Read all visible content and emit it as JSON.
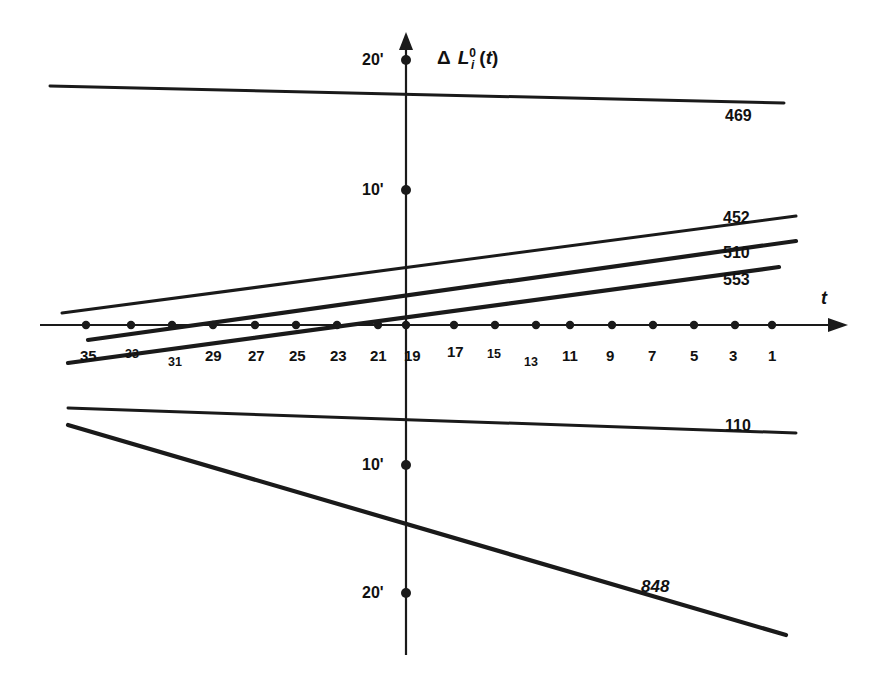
{
  "chart_data": {
    "type": "line",
    "title": "",
    "xlabel": "t",
    "ylabel": "Δ L i 0 (t)",
    "ylabel_parts": {
      "delta": "Δ",
      "base": "L",
      "superscript": "0",
      "subscript": "i",
      "argument": "(t)"
    },
    "x_axis": {
      "direction": "decreasing left to right",
      "tick_values": [
        35,
        33,
        31,
        29,
        27,
        25,
        23,
        21,
        19,
        17,
        15,
        13,
        11,
        9,
        7,
        5,
        3,
        1
      ],
      "tick_labels": [
        "35",
        "33",
        "31",
        "29",
        "27",
        "25",
        "23",
        "21",
        "19",
        "17",
        "15",
        "13",
        "11",
        "9",
        "7",
        "5",
        "3",
        "1"
      ],
      "axis_arrow": true,
      "origin_tick": "19"
    },
    "y_axis": {
      "tick_labels": [
        "20'",
        "10'",
        "10'",
        "20'"
      ],
      "tick_values": [
        20,
        10,
        -10,
        -20
      ],
      "unit": "'",
      "axis_arrow": true
    },
    "grid": false,
    "legend": "inline right-edge labels",
    "series": [
      {
        "name": "469",
        "label": "469",
        "style": "near-horizontal slight downward to the right",
        "points": [
          {
            "x": 35.8,
            "y": 19.0
          },
          {
            "x": 0.2,
            "y": 17.6
          }
        ]
      },
      {
        "name": "452",
        "label": "452",
        "style": "rising to the right",
        "points": [
          {
            "x": 35.3,
            "y": 0.9
          },
          {
            "x": 0.6,
            "y": 8.4
          }
        ]
      },
      {
        "name": "510",
        "label": "510",
        "style": "rising to the right, crosses axis near t=28",
        "points": [
          {
            "x": 34.0,
            "y": -1.3
          },
          {
            "x": 0.6,
            "y": 7.4
          }
        ]
      },
      {
        "name": "553",
        "label": "553",
        "style": "steeply rising, crosses axis near t=11",
        "points": [
          {
            "x": 35.0,
            "y": -3.4
          },
          {
            "x": 1.4,
            "y": 5.3
          }
        ]
      },
      {
        "name": "110",
        "label": "110",
        "style": "nearly horizontal, slight decline to the right",
        "points": [
          {
            "x": 35.0,
            "y": -6.4
          },
          {
            "x": 0.6,
            "y": -7.6
          }
        ]
      },
      {
        "name": "848",
        "label": "848",
        "style": "steeply falling to the right",
        "points": [
          {
            "x": 35.0,
            "y": -8.3
          },
          {
            "x": -0.6,
            "y": -25.5
          }
        ]
      }
    ]
  },
  "labels": {
    "y_top": "20'",
    "y_upper_mid": "10'",
    "y_lower_mid": "10'",
    "y_bottom": "20'",
    "x_axis_name": "t"
  },
  "x_ticks": [
    {
      "text": "35",
      "x": 80,
      "y": 348,
      "small": false
    },
    {
      "text": "33",
      "x": 125,
      "y": 348,
      "small": true
    },
    {
      "text": "31",
      "x": 168,
      "y": 356,
      "small": true
    },
    {
      "text": "29",
      "x": 205,
      "y": 348,
      "small": false
    },
    {
      "text": "27",
      "x": 248,
      "y": 348,
      "small": false
    },
    {
      "text": "25",
      "x": 289,
      "y": 348,
      "small": false
    },
    {
      "text": "23",
      "x": 330,
      "y": 348,
      "small": false
    },
    {
      "text": "21",
      "x": 370,
      "y": 348,
      "small": false
    },
    {
      "text": "19",
      "x": 404,
      "y": 348,
      "small": false
    },
    {
      "text": "17",
      "x": 447,
      "y": 344,
      "small": false
    },
    {
      "text": "15",
      "x": 487,
      "y": 348,
      "small": true
    },
    {
      "text": "13",
      "x": 524,
      "y": 356,
      "small": true
    },
    {
      "text": "11",
      "x": 562,
      "y": 348,
      "small": false
    },
    {
      "text": "9",
      "x": 606,
      "y": 348,
      "small": false
    },
    {
      "text": "7",
      "x": 648,
      "y": 348,
      "small": false
    },
    {
      "text": "5",
      "x": 690,
      "y": 348,
      "small": false
    },
    {
      "text": "3",
      "x": 729,
      "y": 348,
      "small": false
    },
    {
      "text": "1",
      "x": 768,
      "y": 348,
      "small": false
    }
  ],
  "series_labels": [
    {
      "text": "469",
      "x": 725,
      "y": 108,
      "italic": false
    },
    {
      "text": "452",
      "x": 723,
      "y": 210,
      "italic": false
    },
    {
      "text": "510",
      "x": 723,
      "y": 245,
      "italic": false
    },
    {
      "text": "553",
      "x": 723,
      "y": 272,
      "italic": false
    },
    {
      "text": "110",
      "x": 725,
      "y": 418,
      "italic": false
    },
    {
      "text": "848",
      "x": 641,
      "y": 578,
      "italic": true
    }
  ]
}
